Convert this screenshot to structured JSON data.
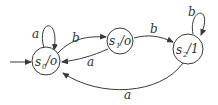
{
  "diagram": {
    "type": "moore-machine-state-diagram",
    "start_state": "s0",
    "states": [
      {
        "id": "s0",
        "name": "s",
        "sub": "0",
        "output": "/o"
      },
      {
        "id": "s1",
        "name": "s",
        "sub": "1",
        "output": "/o"
      },
      {
        "id": "s2",
        "name": "s",
        "sub": "2",
        "output": "/1"
      }
    ],
    "transitions": [
      {
        "from": "s0",
        "to": "s0",
        "label": "a"
      },
      {
        "from": "s0",
        "to": "s1",
        "label": "b"
      },
      {
        "from": "s1",
        "to": "s0",
        "label": "a"
      },
      {
        "from": "s1",
        "to": "s2",
        "label": "b"
      },
      {
        "from": "s2",
        "to": "s2",
        "label": "b"
      },
      {
        "from": "s2",
        "to": "s0",
        "label": "a"
      }
    ]
  }
}
